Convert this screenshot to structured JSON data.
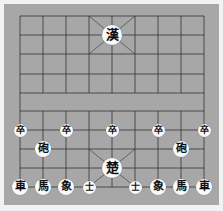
{
  "game": "Xiangqi",
  "colors": {
    "board": "#a7a7a7",
    "lines": "#333333",
    "piece": "#fafafa",
    "text": "#111111"
  },
  "grid": {
    "cols_x": [
      20,
      43,
      66,
      89,
      112,
      135,
      158,
      181,
      204
    ],
    "rows_y": [
      16,
      35,
      54,
      74,
      93,
      111,
      130,
      149,
      168,
      187
    ]
  },
  "pieces": [
    {
      "name": "general-top",
      "label": "漢",
      "col": 4,
      "row": 1,
      "size": "big"
    },
    {
      "name": "soldier-1",
      "label": "卒",
      "col": 0,
      "row": 6,
      "size": "small"
    },
    {
      "name": "soldier-2",
      "label": "卒",
      "col": 2,
      "row": 6,
      "size": "small"
    },
    {
      "name": "soldier-3",
      "label": "卒",
      "col": 4,
      "row": 6,
      "size": "small"
    },
    {
      "name": "soldier-4",
      "label": "卒",
      "col": 6,
      "row": 6,
      "size": "small"
    },
    {
      "name": "soldier-5",
      "label": "卒",
      "col": 8,
      "row": 6,
      "size": "small"
    },
    {
      "name": "cannon-left",
      "label": "砲",
      "col": 1,
      "row": 7,
      "size": "normal"
    },
    {
      "name": "cannon-right",
      "label": "砲",
      "col": 7,
      "row": 7,
      "size": "normal"
    },
    {
      "name": "general-bottom",
      "label": "楚",
      "col": 4,
      "row": 8,
      "size": "big"
    },
    {
      "name": "chariot-left",
      "label": "車",
      "col": 0,
      "row": 9,
      "size": "normal"
    },
    {
      "name": "horse-left",
      "label": "馬",
      "col": 1,
      "row": 9,
      "size": "normal"
    },
    {
      "name": "elephant-left",
      "label": "象",
      "col": 2,
      "row": 9,
      "size": "normal"
    },
    {
      "name": "advisor-left",
      "label": "士",
      "col": 3,
      "row": 9,
      "size": "small"
    },
    {
      "name": "advisor-right",
      "label": "士",
      "col": 5,
      "row": 9,
      "size": "small"
    },
    {
      "name": "elephant-right",
      "label": "象",
      "col": 6,
      "row": 9,
      "size": "normal"
    },
    {
      "name": "horse-right",
      "label": "馬",
      "col": 7,
      "row": 9,
      "size": "normal"
    },
    {
      "name": "chariot-right",
      "label": "車",
      "col": 8,
      "row": 9,
      "size": "normal"
    }
  ]
}
